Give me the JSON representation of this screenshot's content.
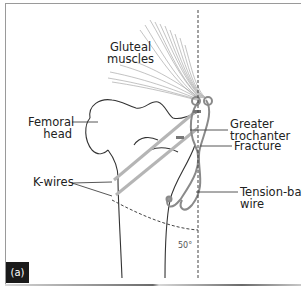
{
  "figure": {
    "panel_label": "(a)",
    "labels": {
      "gluteal_line1": "Gluteal",
      "gluteal_line2": "muscles",
      "femoral_line1": "Femoral",
      "femoral_line2": "head",
      "greater_line1": "Greater",
      "greater_line2": "trochanter",
      "fracture": "Fracture",
      "kwires": "K-wires",
      "tension_line1": "Tension-band",
      "tension_line2": "wire",
      "angle": "50°"
    },
    "colors": {
      "line": "#333333",
      "muscle": "#8a8a8a",
      "wire": "#9a9a9a",
      "badge": "#1a1a1a"
    }
  }
}
